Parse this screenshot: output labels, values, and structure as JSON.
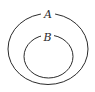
{
  "diagram": {
    "type": "venn",
    "sets": [
      {
        "label": "A",
        "role": "outer"
      },
      {
        "label": "B",
        "role": "inner",
        "subset_of": "A"
      }
    ],
    "stroke_color": "#2a2a2a",
    "background": "#ffffff"
  }
}
